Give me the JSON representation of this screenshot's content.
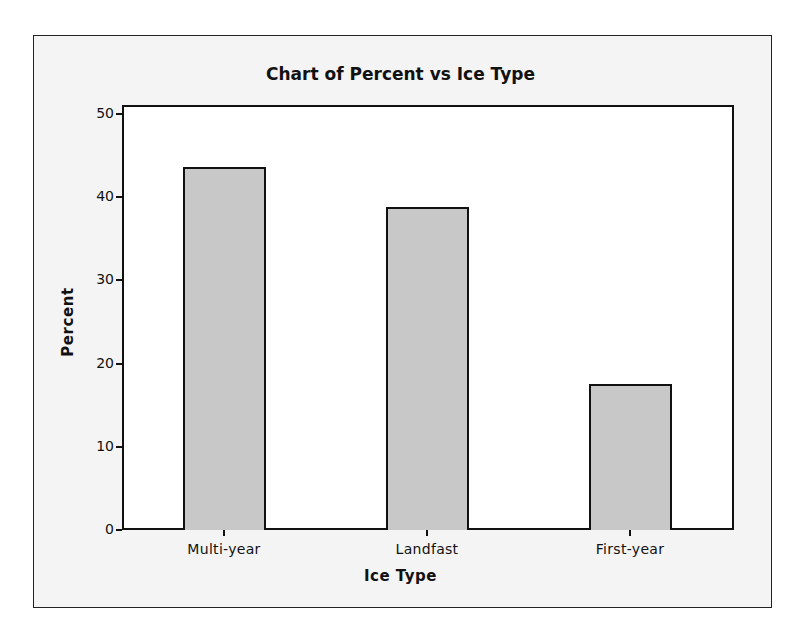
{
  "chart": {
    "title": "Chart of Percent vs Ice Type",
    "xlabel": "Ice Type",
    "ylabel": "Percent",
    "yticks": [
      "0",
      "10",
      "20",
      "30",
      "40",
      "50"
    ],
    "categories": [
      "Multi-year",
      "Landfast",
      "First-year"
    ]
  },
  "colors": {
    "bar_fill": "#c8c8c8",
    "bar_edge": "#111111",
    "frame_bg": "#f4f4f4",
    "plot_bg": "#ffffff"
  },
  "chart_data": {
    "type": "bar",
    "title": "Chart of Percent vs Ice Type",
    "xlabel": "Ice Type",
    "ylabel": "Percent",
    "categories": [
      "Multi-year",
      "Landfast",
      "First-year"
    ],
    "values": [
      43.6,
      38.8,
      17.6
    ],
    "ylim": [
      0,
      50
    ],
    "yticks": [
      0,
      10,
      20,
      30,
      40,
      50
    ],
    "grid": false,
    "legend": null
  }
}
